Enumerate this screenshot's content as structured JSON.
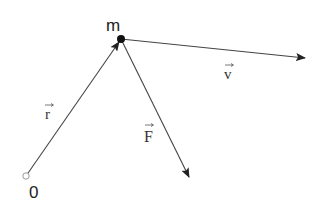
{
  "diagram": {
    "colors": {
      "line": "#444444",
      "point": "#111111",
      "origin_stroke": "#999999",
      "text": "#222222"
    },
    "origin": {
      "label": "0",
      "x": 26,
      "y": 176
    },
    "mass": {
      "label": "m",
      "x": 121,
      "y": 39
    },
    "vectors": [
      {
        "id": "r",
        "label": "r",
        "from": [
          26,
          176
        ],
        "to": [
          121,
          39
        ],
        "label_pos": [
          48,
          118
        ]
      },
      {
        "id": "v",
        "label": "v",
        "from": [
          121,
          39
        ],
        "to": [
          305,
          58
        ],
        "label_pos": [
          229,
          78
        ]
      },
      {
        "id": "F",
        "label": "F",
        "from": [
          121,
          39
        ],
        "to": [
          189,
          177
        ],
        "label_pos": [
          147,
          140
        ]
      }
    ]
  }
}
